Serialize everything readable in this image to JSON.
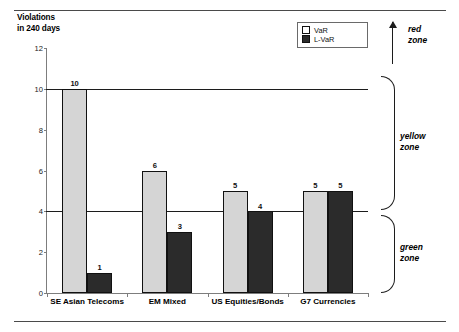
{
  "figure": {
    "top_rule": "horizontal-rule",
    "bottom_rule": "horizontal-rule"
  },
  "legend": {
    "position": "top-right",
    "entries": [
      {
        "label": "VaR",
        "swatch": "light-square",
        "color": "#d5d5d5"
      },
      {
        "label": "L-VaR",
        "swatch": "dark-square",
        "color": "#2b2b2b"
      }
    ]
  },
  "zones": [
    {
      "name": "red-zone",
      "label_line1": "red",
      "label_line2": "zone",
      "marker": "up-arrow"
    },
    {
      "name": "yellow-zone",
      "label_line1": "yellow",
      "label_line2": "zone",
      "marker": "brace"
    },
    {
      "name": "green-zone",
      "label_line1": "green",
      "label_line2": "zone",
      "marker": "brace"
    }
  ],
  "chart_data": {
    "type": "bar",
    "title": "",
    "ylabel_line1": "Violations",
    "ylabel_line2": "in 240 days",
    "xlabel": "",
    "ylim": [
      0,
      12
    ],
    "yticks": [
      0,
      2,
      4,
      6,
      8,
      10,
      12
    ],
    "grid": false,
    "legend_position": "top-right",
    "categories": [
      "SE Asian Telecoms",
      "EM Mixed",
      "US Equities/Bonds",
      "G7 Currencies"
    ],
    "series": [
      {
        "name": "VaR",
        "color": "#d5d5d5",
        "values": [
          10,
          6,
          5,
          5
        ]
      },
      {
        "name": "L-VaR",
        "color": "#2b2b2b",
        "values": [
          1,
          3,
          4,
          5
        ]
      }
    ],
    "threshold_lines": [
      {
        "value": 10,
        "name": "red-zone-threshold"
      },
      {
        "value": 4,
        "name": "yellow-zone-threshold"
      }
    ]
  }
}
